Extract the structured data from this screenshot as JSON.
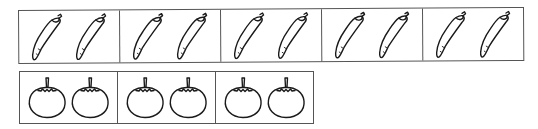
{
  "figure": {
    "rows": [
      {
        "name": "peppers",
        "item_icon": "chili-pepper-icon",
        "groups": [
          2,
          2,
          2,
          2,
          2
        ]
      },
      {
        "name": "tomatoes",
        "item_icon": "tomato-icon",
        "groups": [
          2,
          2,
          2
        ]
      }
    ],
    "colors": {
      "stroke": "#1a1a1a",
      "border": "#555555",
      "background": "#ffffff"
    }
  }
}
